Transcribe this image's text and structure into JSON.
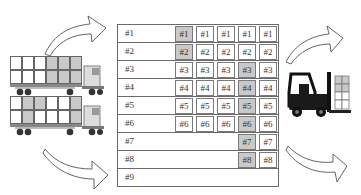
{
  "colors": {
    "shaded": "#c9c9c9",
    "border": "#6a6a6a",
    "text": "#333333"
  },
  "table": {
    "rows": [
      {
        "label": "#1",
        "cells": [
          {
            "text": "#1",
            "shaded": true
          },
          {
            "text": "#1",
            "shaded": false
          },
          {
            "text": "#1",
            "shaded": false
          },
          {
            "text": "#1",
            "shaded": false
          },
          {
            "text": "#1",
            "shaded": false
          }
        ]
      },
      {
        "label": "#2",
        "cells": [
          {
            "text": "#2",
            "shaded": true
          },
          {
            "text": "#2",
            "shaded": false
          },
          {
            "text": "#2",
            "shaded": false
          },
          {
            "text": "#2",
            "shaded": false
          },
          {
            "text": "#2",
            "shaded": false
          }
        ]
      },
      {
        "label": "#3",
        "cells": [
          {
            "text": "#3",
            "shaded": false
          },
          {
            "text": "#3",
            "shaded": false
          },
          {
            "text": "#3",
            "shaded": false
          },
          {
            "text": "#3",
            "shaded": true
          },
          {
            "text": "#3",
            "shaded": false
          }
        ]
      },
      {
        "label": "#4",
        "cells": [
          {
            "text": "#4",
            "shaded": false
          },
          {
            "text": "#4",
            "shaded": false
          },
          {
            "text": "#4",
            "shaded": false
          },
          {
            "text": "#4",
            "shaded": true
          },
          {
            "text": "#4",
            "shaded": false
          }
        ]
      },
      {
        "label": "#5",
        "cells": [
          {
            "text": "#5",
            "shaded": false
          },
          {
            "text": "#5",
            "shaded": false
          },
          {
            "text": "#5",
            "shaded": false
          },
          {
            "text": "#5",
            "shaded": true
          },
          {
            "text": "#5",
            "shaded": false
          }
        ]
      },
      {
        "label": "#6",
        "cells": [
          {
            "text": "#6",
            "shaded": false
          },
          {
            "text": "#6",
            "shaded": false
          },
          {
            "text": "#6",
            "shaded": false
          },
          {
            "text": "#6",
            "shaded": true
          },
          {
            "text": "#6",
            "shaded": false
          }
        ]
      },
      {
        "label": "#7",
        "cells": [
          null,
          null,
          null,
          {
            "text": "#7",
            "shaded": true
          },
          {
            "text": "#7",
            "shaded": false
          }
        ]
      },
      {
        "label": "#8",
        "cells": [
          null,
          null,
          null,
          {
            "text": "#8",
            "shaded": true
          },
          {
            "text": "#8",
            "shaded": false
          }
        ]
      },
      {
        "label": "#9",
        "cells": [
          null,
          null,
          null,
          null,
          null
        ]
      }
    ]
  },
  "trucks": [
    {
      "cargo_grid": [
        [
          false,
          false,
          false,
          true,
          true,
          true
        ],
        [
          false,
          false,
          false,
          true,
          true,
          true
        ]
      ]
    },
    {
      "cargo_grid": [
        [
          false,
          true,
          true,
          false,
          false,
          true
        ],
        [
          false,
          true,
          false,
          false,
          false,
          true
        ]
      ]
    }
  ],
  "icons": {
    "left_top_arrow": "curved-arrow-up-right",
    "left_bottom_arrow": "curved-arrow-down-right",
    "right_top_arrow": "curved-arrow-up-right",
    "right_bottom_arrow": "curved-arrow-down-right",
    "truck": "truck-icon",
    "forklift": "forklift-icon"
  }
}
